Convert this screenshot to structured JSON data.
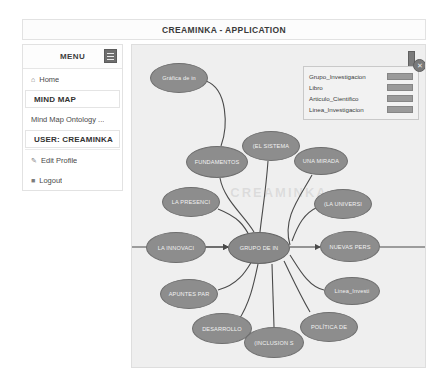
{
  "header": {
    "title": "CREAMINKA - APPLICATION"
  },
  "sidebar": {
    "menu_label": "MENU",
    "toggle_icon": "hamburger-icon",
    "items": [
      {
        "label": "Home",
        "icon": "home-icon",
        "style": "plain"
      },
      {
        "label": "MIND MAP",
        "icon": "",
        "style": "boxed-strong"
      },
      {
        "label": "Mind Map Ontology ...",
        "icon": "",
        "style": "plain"
      },
      {
        "label": "USER: CREAMINKA",
        "icon": "",
        "style": "boxed-strong"
      },
      {
        "label": "Edit Profile",
        "icon": "pencil-icon",
        "style": "plain"
      },
      {
        "label": "Logout",
        "icon": "power-icon",
        "style": "plain"
      }
    ]
  },
  "legend": {
    "close_icon": "close-icon",
    "entries": [
      {
        "label": "Grupo_Investigacion",
        "color": "#9a9a9a"
      },
      {
        "label": "Libro",
        "color": "#9a9a9a"
      },
      {
        "label": "Articulo_Cientifico",
        "color": "#9a9a9a"
      },
      {
        "label": "Linea_Investigacion",
        "color": "#9a9a9a"
      }
    ]
  },
  "canvas": {
    "watermark": "CREAMINKA",
    "handle_icon": "resize-handle-icon",
    "node_fill": "#8d8d8d",
    "background": "#efefef",
    "nodes": [
      {
        "id": "grafica",
        "label": "Gráfica de in",
        "x": 18,
        "y": 18,
        "w": 58,
        "h": 30
      },
      {
        "id": "fundamentos",
        "label": "FUNDAMENTOS",
        "x": 54,
        "y": 101,
        "w": 62,
        "h": 32
      },
      {
        "id": "sistema",
        "label": "(EL SISTEMA",
        "x": 110,
        "y": 86,
        "w": 58,
        "h": 30
      },
      {
        "id": "unamirada",
        "label": "UNA MIRADA",
        "x": 162,
        "y": 102,
        "w": 54,
        "h": 28
      },
      {
        "id": "lapresencia",
        "label": "LA PRESENCI",
        "x": 30,
        "y": 142,
        "w": 58,
        "h": 30
      },
      {
        "id": "launiversi",
        "label": "(LA UNIVERSI",
        "x": 182,
        "y": 144,
        "w": 58,
        "h": 30
      },
      {
        "id": "lainnovaci",
        "label": "LA INNOVACI",
        "x": 14,
        "y": 187,
        "w": 60,
        "h": 31
      },
      {
        "id": "grupodein",
        "label": "GRUPO DE IN",
        "x": 96,
        "y": 187,
        "w": 62,
        "h": 32,
        "center": true
      },
      {
        "id": "nuevasperspectivas",
        "label": "NUEVAS PERS",
        "x": 188,
        "y": 186,
        "w": 60,
        "h": 31
      },
      {
        "id": "apuntespara",
        "label": "APUNTES PAR",
        "x": 28,
        "y": 234,
        "w": 58,
        "h": 30
      },
      {
        "id": "linea_investi",
        "label": "Linea_Investi",
        "x": 192,
        "y": 232,
        "w": 56,
        "h": 28
      },
      {
        "id": "desarrollo",
        "label": "DESARROLLO",
        "x": 60,
        "y": 268,
        "w": 60,
        "h": 31
      },
      {
        "id": "inclusion",
        "label": "(INCLUSION S",
        "x": 112,
        "y": 282,
        "w": 60,
        "h": 31
      },
      {
        "id": "politica",
        "label": "POLÍTICA DE",
        "x": 168,
        "y": 267,
        "w": 58,
        "h": 30
      }
    ]
  }
}
